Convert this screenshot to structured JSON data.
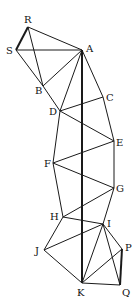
{
  "diagram": {
    "title": "",
    "nodes": [
      {
        "id": "R",
        "label": "R",
        "x": 28,
        "y": 27,
        "lx": 24,
        "ly": 23
      },
      {
        "id": "S",
        "label": "S",
        "x": 16,
        "y": 50,
        "lx": 6,
        "ly": 54
      },
      {
        "id": "A",
        "label": "A",
        "x": 82,
        "y": 50,
        "lx": 86,
        "ly": 52
      },
      {
        "id": "B",
        "label": "B",
        "x": 43,
        "y": 86,
        "lx": 35,
        "ly": 94
      },
      {
        "id": "C",
        "label": "C",
        "x": 103,
        "y": 97,
        "lx": 106,
        "ly": 101
      },
      {
        "id": "D",
        "label": "D",
        "x": 60,
        "y": 111,
        "lx": 49,
        "ly": 115
      },
      {
        "id": "E",
        "label": "E",
        "x": 114,
        "y": 141,
        "lx": 116,
        "ly": 146
      },
      {
        "id": "F",
        "label": "F",
        "x": 53,
        "y": 163,
        "lx": 44,
        "ly": 167
      },
      {
        "id": "G",
        "label": "G",
        "x": 114,
        "y": 188,
        "lx": 116,
        "ly": 192
      },
      {
        "id": "H",
        "label": "H",
        "x": 63,
        "y": 217,
        "lx": 50,
        "ly": 220
      },
      {
        "id": "I",
        "label": "I",
        "x": 103,
        "y": 224,
        "lx": 107,
        "ly": 227
      },
      {
        "id": "J",
        "label": "J",
        "x": 44,
        "y": 250,
        "lx": 35,
        "ly": 254
      },
      {
        "id": "P",
        "label": "P",
        "x": 122,
        "y": 249,
        "lx": 125,
        "ly": 251
      },
      {
        "id": "K",
        "label": "K",
        "x": 82,
        "y": 283,
        "lx": 77,
        "ly": 296
      },
      {
        "id": "Q",
        "label": "Q",
        "x": 120,
        "y": 285,
        "lx": 122,
        "ly": 296
      }
    ],
    "edges": [
      {
        "from": "R",
        "to": "S",
        "thick": true
      },
      {
        "from": "R",
        "to": "A",
        "thick": false
      },
      {
        "from": "R",
        "to": "B",
        "thick": false
      },
      {
        "from": "S",
        "to": "A",
        "thick": false
      },
      {
        "from": "S",
        "to": "B",
        "thick": false
      },
      {
        "from": "A",
        "to": "B",
        "thick": false
      },
      {
        "from": "A",
        "to": "D",
        "thick": false
      },
      {
        "from": "A",
        "to": "K",
        "thick": true
      },
      {
        "from": "A",
        "to": "C",
        "thick": false
      },
      {
        "from": "B",
        "to": "D",
        "thick": false
      },
      {
        "from": "C",
        "to": "E",
        "thick": false
      },
      {
        "from": "D",
        "to": "C",
        "thick": false
      },
      {
        "from": "D",
        "to": "E",
        "thick": false
      },
      {
        "from": "D",
        "to": "F",
        "thick": false
      },
      {
        "from": "F",
        "to": "E",
        "thick": false
      },
      {
        "from": "F",
        "to": "G",
        "thick": false
      },
      {
        "from": "F",
        "to": "H",
        "thick": false
      },
      {
        "from": "E",
        "to": "G",
        "thick": false
      },
      {
        "from": "G",
        "to": "H",
        "thick": false
      },
      {
        "from": "G",
        "to": "I",
        "thick": false
      },
      {
        "from": "H",
        "to": "I",
        "thick": false
      },
      {
        "from": "H",
        "to": "J",
        "thick": false
      },
      {
        "from": "I",
        "to": "J",
        "thick": false
      },
      {
        "from": "I",
        "to": "K",
        "thick": false
      },
      {
        "from": "I",
        "to": "P",
        "thick": false
      },
      {
        "from": "I",
        "to": "Q",
        "thick": false
      },
      {
        "from": "J",
        "to": "K",
        "thick": false
      },
      {
        "from": "K",
        "to": "P",
        "thick": false
      },
      {
        "from": "K",
        "to": "Q",
        "thick": false
      },
      {
        "from": "P",
        "to": "Q",
        "thick": true
      }
    ]
  }
}
